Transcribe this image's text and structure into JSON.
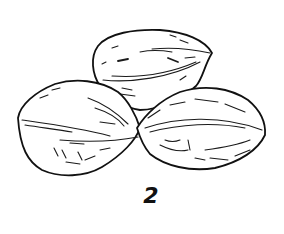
{
  "illustration": {
    "subject": "three nuts line drawing",
    "figure_label": "2",
    "ink_color": "#111111",
    "background_color": "#ffffff"
  }
}
